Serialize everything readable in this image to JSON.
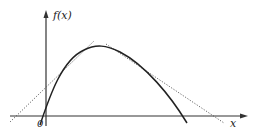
{
  "diagram": {
    "y_axis_label": "f(x)",
    "x_axis_label": "x",
    "origin_label": "0",
    "colors": {
      "curve": "#222222",
      "axis": "#333333",
      "tangent": "#555555",
      "background": "#ffffff"
    },
    "elements": [
      {
        "type": "axis",
        "name": "x-axis",
        "direction": "horizontal",
        "arrow": "right"
      },
      {
        "type": "axis",
        "name": "y-axis",
        "direction": "vertical",
        "arrow": "up"
      },
      {
        "type": "curve",
        "name": "concave-function",
        "shape": "downward parabola-like, rising from below origin to a peak then falling across x-axis"
      },
      {
        "type": "line",
        "name": "left-tangent",
        "style": "dotted"
      },
      {
        "type": "line",
        "name": "right-tangent",
        "style": "dotted"
      }
    ]
  }
}
